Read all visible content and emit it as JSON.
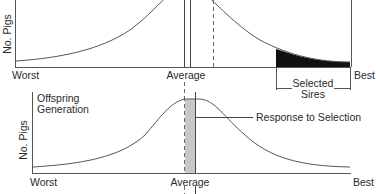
{
  "top_panel": {
    "y_label": "No. Pigs",
    "x_left_label": "Worst",
    "x_center_label": "Average",
    "x_right_label": "Best",
    "selected_label_line1": "Selected",
    "selected_label_line2": "Sires",
    "shaded_region_color": "#111111"
  },
  "bottom_panel": {
    "title_line1": "Offspring",
    "title_line2": "Generation",
    "y_label": "No. Pigs",
    "x_left_label": "Worst",
    "x_center_label": "Average",
    "x_right_label": "Best",
    "response_label": "Response to Selection",
    "shaded_region_color": "#c8c8c8"
  }
}
